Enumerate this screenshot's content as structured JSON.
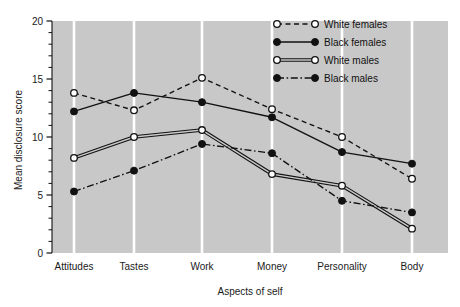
{
  "chart_data": {
    "type": "line",
    "title": "",
    "xlabel": "Aspects of self",
    "ylabel": "Mean disclosure score",
    "categories": [
      "Attitudes",
      "Tastes",
      "Work",
      "Money",
      "Personality",
      "Body"
    ],
    "ylim": [
      0,
      20
    ],
    "yticks": [
      0,
      5,
      10,
      15,
      20
    ],
    "yticklabels": [
      "0",
      "5",
      "10",
      "15",
      "20"
    ],
    "minor_tick_step": 1,
    "grid": "vertical-white-gridlines",
    "plot_background": "#c8c8c8",
    "legend_position": "top-right",
    "series": [
      {
        "name": "White females",
        "marker": "open-circle",
        "line": "dashed",
        "color": "#111111",
        "values": [
          13.8,
          12.3,
          15.1,
          12.4,
          10.0,
          6.4
        ]
      },
      {
        "name": "Black females",
        "marker": "filled-circle",
        "line": "solid",
        "color": "#111111",
        "values": [
          12.2,
          13.8,
          13.0,
          11.7,
          8.7,
          7.7
        ]
      },
      {
        "name": "White males",
        "marker": "open-circle",
        "line": "double-solid",
        "color": "#111111",
        "values": [
          8.2,
          10.0,
          10.6,
          6.8,
          5.8,
          2.1
        ]
      },
      {
        "name": "Black males",
        "marker": "filled-circle",
        "line": "dash-dot",
        "color": "#111111",
        "values": [
          5.3,
          7.1,
          9.4,
          8.6,
          4.5,
          3.5
        ]
      }
    ]
  },
  "legend": {
    "items": [
      {
        "label": "White females"
      },
      {
        "label": "Black females"
      },
      {
        "label": "White males"
      },
      {
        "label": "Black males"
      }
    ]
  }
}
